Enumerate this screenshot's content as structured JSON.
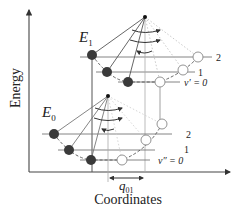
{
  "axes": {
    "y_label": "Energy",
    "x_label": "Coordinates"
  },
  "states": {
    "upper": {
      "label": "E",
      "subscript": "1",
      "levels": [
        "2",
        "1",
        "v′ = 0"
      ]
    },
    "lower": {
      "label": "E",
      "subscript": "0",
      "levels": [
        "2",
        "1",
        "v″ = 0"
      ]
    }
  },
  "displacement": {
    "label": "q",
    "subscript": "01"
  },
  "colors": {
    "line": "#555555",
    "light_line": "#9a9a9a",
    "ball": "#3a3a3a",
    "open_circle": "#8a8a8a",
    "text": "#222222"
  }
}
